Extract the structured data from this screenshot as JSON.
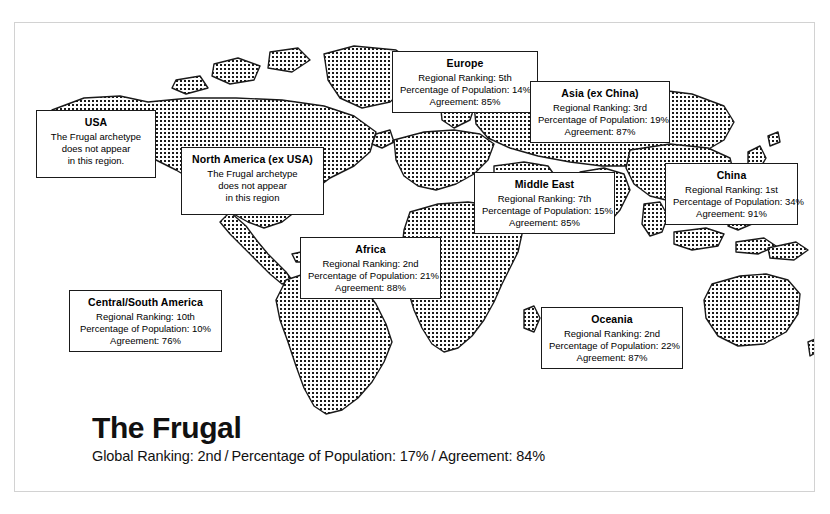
{
  "page": {
    "archetype_title": "The Frugal",
    "global_stats": {
      "ranking_label": "Global Ranking: 2nd",
      "separator1": "/",
      "population_label": "Percentage of Population: 17%",
      "separator2": "/",
      "agreement_label": "Agreement: 84%"
    }
  },
  "map": {
    "icon": "world-map",
    "style": "dotted-fill-landmass",
    "colors": {
      "outline": "#1a1a1a",
      "fill_dots": "#1a1a1a",
      "ocean": "#ffffff",
      "frame": "#d2d2d2"
    }
  },
  "callouts": [
    {
      "id": "usa",
      "title": "USA",
      "lines": [
        "The Frugal archetype",
        "does not appear",
        "in this region."
      ]
    },
    {
      "id": "north-america",
      "title": "North America (ex USA)",
      "lines": [
        "The Frugal archetype",
        "does not appear",
        "in this region"
      ]
    },
    {
      "id": "europe",
      "title": "Europe",
      "lines": [
        "Regional Ranking: 5th",
        "Percentage of Population: 14%",
        "Agreement: 85%"
      ]
    },
    {
      "id": "asia",
      "title": "Asia (ex China)",
      "lines": [
        "Regional Ranking: 3rd",
        "Percentage of Population: 19%",
        "Agreement: 87%"
      ]
    },
    {
      "id": "china",
      "title": "China",
      "lines": [
        "Regional Ranking: 1st",
        "Percentage of Population: 34%",
        "Agreement: 91%"
      ]
    },
    {
      "id": "middle-east",
      "title": "Middle East",
      "lines": [
        "Regional Ranking: 7th",
        "Percentage of Population: 15%",
        "Agreement: 85%"
      ]
    },
    {
      "id": "africa",
      "title": "Africa",
      "lines": [
        "Regional Ranking: 2nd",
        "Percentage of Population: 21%",
        "Agreement: 88%"
      ]
    },
    {
      "id": "central-south-america",
      "title": "Central/South America",
      "lines": [
        "Regional Ranking: 10th",
        "Percentage of Population: 10%",
        "Agreement: 76%"
      ]
    },
    {
      "id": "oceania",
      "title": "Oceania",
      "lines": [
        "Regional Ranking: 2nd",
        "Percentage of Population: 22%",
        "Agreement: 87%"
      ]
    }
  ]
}
